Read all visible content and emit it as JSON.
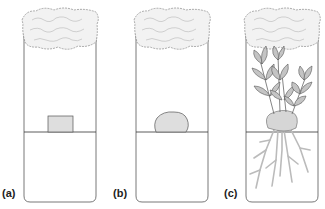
{
  "figure": {
    "panels": [
      {
        "label": "(a)",
        "stage": "explant",
        "description": "Small rectangular tissue explant resting on agar medium"
      },
      {
        "label": "(b)",
        "stage": "callus",
        "description": "Irregular callus mass on agar medium"
      },
      {
        "label": "(c)",
        "stage": "plantlet",
        "description": "Regenerated plantlet with leafy shoots above and roots in agar"
      }
    ],
    "elements": {
      "plug": "cotton-plug",
      "medium": "agar-medium",
      "vessel": "culture-tube"
    },
    "colors": {
      "outline": "#555555",
      "fill_gray": "#d9d9d9",
      "leaf": "#bfbfbf",
      "root": "#c8c8c8",
      "background": "#ffffff"
    }
  }
}
